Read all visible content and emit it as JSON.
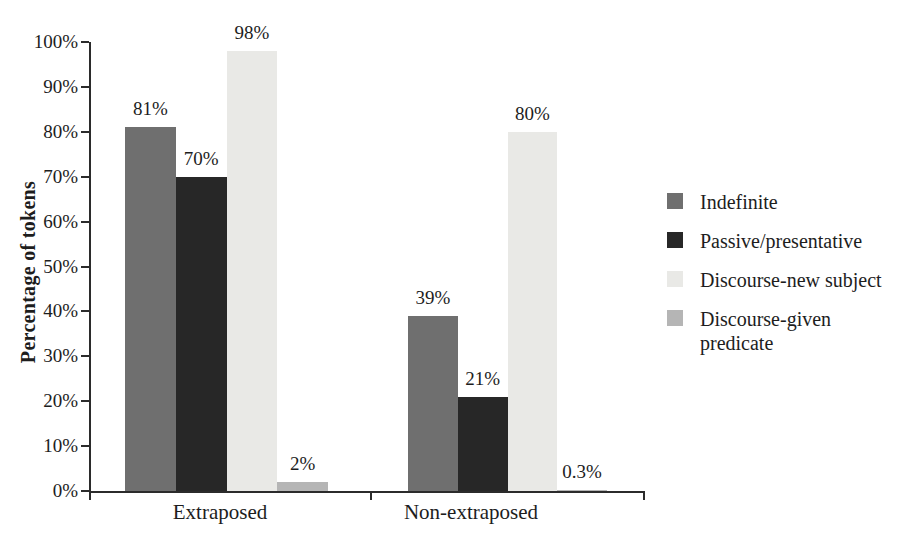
{
  "chart_data": {
    "type": "bar",
    "categories": [
      "Extraposed",
      "Non-extraposed"
    ],
    "series": [
      {
        "name": "Indefinite",
        "color": "#6f6f6f",
        "values": [
          81,
          39
        ],
        "value_labels": [
          "81%",
          "39%"
        ]
      },
      {
        "name": "Passive/presentative",
        "color": "#272727",
        "values": [
          70,
          21
        ],
        "value_labels": [
          "70%",
          "21%"
        ]
      },
      {
        "name": "Discourse-new subject",
        "color": "#e9e9e6",
        "values": [
          98,
          80
        ],
        "value_labels": [
          "98%",
          "80%"
        ]
      },
      {
        "name": "Discourse-given predicate",
        "color": "#b5b5b5",
        "values": [
          2,
          0.3
        ],
        "value_labels": [
          "2%",
          "0.3%"
        ]
      }
    ],
    "title": "",
    "xlabel": "",
    "ylabel": "Percentage of tokens",
    "ylim": [
      0,
      100
    ],
    "yticks": [
      "0%",
      "10%",
      "20%",
      "30%",
      "40%",
      "50%",
      "60%",
      "70%",
      "80%",
      "90%",
      "100%"
    ],
    "grid": false,
    "legend_position": "right",
    "axis_color": "#2b2b2b",
    "text_color": "#1d1d1d"
  }
}
